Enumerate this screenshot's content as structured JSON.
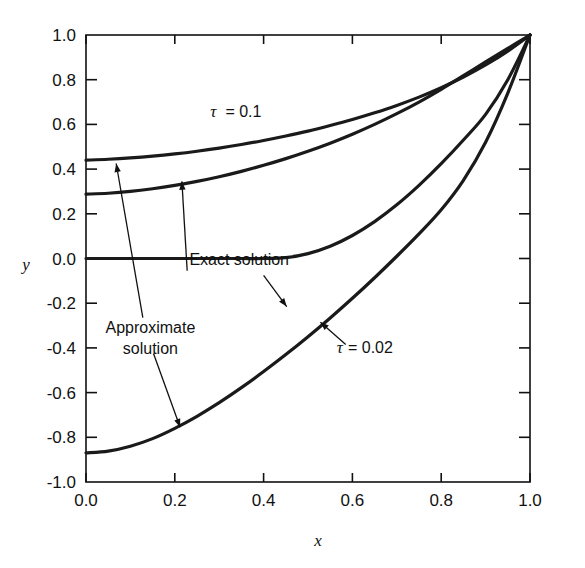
{
  "chart_data": {
    "type": "line",
    "title": "",
    "xlabel": "x",
    "ylabel": "y",
    "xlim": [
      0.0,
      1.0
    ],
    "ylim": [
      -1.0,
      1.0
    ],
    "grid": false,
    "legend": "none",
    "xticks": [
      "0.0",
      "0.2",
      "0.4",
      "0.6",
      "0.8",
      "1.0"
    ],
    "xtick_values": [
      0.0,
      0.2,
      0.4,
      0.6,
      0.8,
      1.0
    ],
    "yticks": [
      "1.0",
      "0.8",
      "0.6",
      "0.4",
      "0.2",
      "0.0",
      "-0.2",
      "-0.4",
      "-0.6",
      "-0.8",
      "-1.0"
    ],
    "ytick_values": [
      1.0,
      0.8,
      0.6,
      0.4,
      0.2,
      0.0,
      -0.2,
      -0.4,
      -0.6,
      -0.8,
      -1.0
    ],
    "line_color": "#1a1a1a",
    "series": [
      {
        "name": "tau = 0.1 approximate solution",
        "tau": 0.1,
        "kind": "approximate",
        "x": [
          0.0,
          0.05,
          0.1,
          0.15,
          0.2,
          0.25,
          0.3,
          0.35,
          0.4,
          0.45,
          0.5,
          0.55,
          0.6,
          0.65,
          0.7,
          0.75,
          0.8,
          0.85,
          0.9,
          0.95,
          1.0
        ],
        "values": [
          0.44,
          0.444,
          0.45,
          0.458,
          0.468,
          0.48,
          0.494,
          0.51,
          0.528,
          0.548,
          0.57,
          0.595,
          0.622,
          0.652,
          0.685,
          0.722,
          0.764,
          0.812,
          0.866,
          0.928,
          1.0
        ]
      },
      {
        "name": "tau = 0.1 exact solution",
        "tau": 0.1,
        "kind": "exact",
        "x": [
          0.0,
          0.05,
          0.1,
          0.15,
          0.2,
          0.25,
          0.3,
          0.35,
          0.4,
          0.45,
          0.5,
          0.55,
          0.6,
          0.65,
          0.7,
          0.75,
          0.8,
          0.85,
          0.9,
          0.95,
          1.0
        ],
        "values": [
          0.288,
          0.292,
          0.3,
          0.312,
          0.327,
          0.345,
          0.366,
          0.39,
          0.417,
          0.447,
          0.48,
          0.516,
          0.556,
          0.6,
          0.648,
          0.7,
          0.757,
          0.818,
          0.88,
          0.94,
          1.0
        ]
      },
      {
        "name": "tau = 0.02 approximate solution",
        "tau": 0.02,
        "kind": "approximate",
        "x": [
          0.0,
          0.05,
          0.1,
          0.15,
          0.2,
          0.25,
          0.3,
          0.35,
          0.4,
          0.45,
          0.5,
          0.55,
          0.6,
          0.65,
          0.7,
          0.75,
          0.8,
          0.85,
          0.9,
          0.95,
          1.0
        ],
        "values": [
          0.0,
          0.0,
          0.0,
          0.0,
          0.0,
          0.0,
          0.0,
          0.0,
          0.0,
          0.004,
          0.022,
          0.055,
          0.103,
          0.165,
          0.24,
          0.327,
          0.424,
          0.53,
          0.645,
          0.8,
          1.0
        ]
      },
      {
        "name": "tau = 0.02 exact solution",
        "tau": 0.02,
        "kind": "exact",
        "x": [
          0.0,
          0.05,
          0.1,
          0.15,
          0.2,
          0.25,
          0.3,
          0.35,
          0.4,
          0.45,
          0.5,
          0.55,
          0.6,
          0.65,
          0.7,
          0.75,
          0.8,
          0.85,
          0.9,
          0.95,
          1.0
        ],
        "values": [
          -0.87,
          -0.862,
          -0.84,
          -0.806,
          -0.76,
          -0.706,
          -0.645,
          -0.578,
          -0.506,
          -0.43,
          -0.35,
          -0.266,
          -0.178,
          -0.086,
          0.01,
          0.11,
          0.218,
          0.35,
          0.52,
          0.74,
          1.0
        ]
      }
    ],
    "annotations": [
      {
        "id": "tau-01",
        "text_tau": "τ",
        "text_rest": "= 0.1",
        "x": 0.28,
        "y": 0.635
      },
      {
        "id": "tau-002",
        "text_tau": "τ",
        "text_rest": "= 0.02",
        "x": 0.565,
        "y": -0.425
      },
      {
        "id": "exact",
        "line1": "Exact solution",
        "line2": "",
        "x": 0.345,
        "y": -0.03
      },
      {
        "id": "approximate",
        "line1": "Approximate",
        "line2": "solution",
        "x": 0.145,
        "y": -0.335
      }
    ]
  }
}
